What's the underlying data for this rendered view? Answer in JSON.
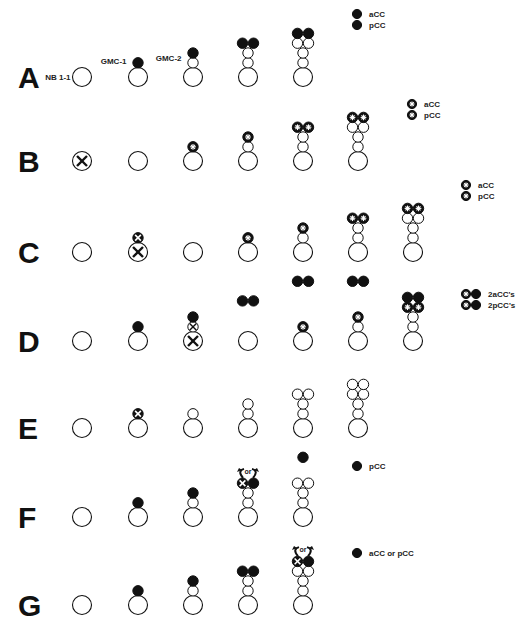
{
  "figure": {
    "cell_types": {
      "open": "unlabeled cell",
      "filled": "aCC/pCC (black)",
      "star": "aCC/pCC with star marker",
      "x": "ablated / killed cell"
    },
    "rows": [
      {
        "label": "A",
        "stages": [
          {
            "base_label": "NB 1-1",
            "stack": []
          },
          {
            "base_label": "GMC-1",
            "stack": [
              [
                "filled"
              ]
            ]
          },
          {
            "base_label": "GMC-2",
            "stack": [
              [
                "open"
              ],
              [
                "filled"
              ]
            ]
          },
          {
            "stack": [
              [
                "open"
              ],
              [
                "open"
              ],
              [
                "filled",
                "filled"
              ]
            ]
          },
          {
            "stack": [
              [
                "open"
              ],
              [
                "open"
              ],
              [
                "open",
                "open"
              ],
              [
                "filled",
                "filled"
              ]
            ]
          }
        ],
        "legend": [
          {
            "icons": [
              "filled"
            ],
            "text": "aCC"
          },
          {
            "icons": [
              "filled"
            ],
            "text": "pCC"
          }
        ]
      },
      {
        "label": "B",
        "stages": [
          {
            "base": "x",
            "stack": []
          },
          {
            "stack": []
          },
          {
            "stack": [
              [
                "star"
              ]
            ]
          },
          {
            "stack": [
              [
                "open"
              ],
              [
                "star"
              ]
            ]
          },
          {
            "stack": [
              [
                "open"
              ],
              [
                "open"
              ],
              [
                "star",
                "star"
              ]
            ]
          },
          {
            "stack": [
              [
                "open"
              ],
              [
                "open"
              ],
              [
                "open",
                "open"
              ],
              [
                "star",
                "star"
              ]
            ]
          }
        ],
        "legend": [
          {
            "icons": [
              "star"
            ],
            "text": "aCC"
          },
          {
            "icons": [
              "star"
            ],
            "text": "pCC"
          }
        ]
      },
      {
        "label": "C",
        "stages": [
          {
            "stack": []
          },
          {
            "base": "x",
            "stack": [
              [
                "x-small"
              ]
            ]
          },
          {
            "stack": []
          },
          {
            "stack": [
              [
                "star"
              ]
            ]
          },
          {
            "stack": [
              [
                "open"
              ],
              [
                "star"
              ]
            ]
          },
          {
            "stack": [
              [
                "open"
              ],
              [
                "open"
              ],
              [
                "star",
                "star"
              ]
            ]
          },
          {
            "stack": [
              [
                "open"
              ],
              [
                "open"
              ],
              [
                "open",
                "open"
              ],
              [
                "star",
                "star"
              ]
            ]
          }
        ],
        "legend": [
          {
            "icons": [
              "star"
            ],
            "text": "aCC"
          },
          {
            "icons": [
              "star"
            ],
            "text": "pCC"
          }
        ]
      },
      {
        "label": "D",
        "stages": [
          {
            "stack": []
          },
          {
            "stack": [
              [
                "filled"
              ]
            ]
          },
          {
            "base": "x",
            "stack": [
              [
                "x-open"
              ],
              [
                "filled"
              ]
            ]
          },
          {
            "stack": [],
            "floating": [
              "filled",
              "filled"
            ],
            "float_level": 3
          },
          {
            "stack": [
              [
                "star"
              ]
            ],
            "floating": [
              "filled",
              "filled"
            ],
            "float_level": 5
          },
          {
            "stack": [
              [
                "open"
              ],
              [
                "star"
              ]
            ],
            "floating": [
              "filled",
              "filled"
            ],
            "float_level": 5
          },
          {
            "stack": [
              [
                "open"
              ],
              [
                "open"
              ],
              [
                "star",
                "star"
              ],
              [
                "filled",
                "filled"
              ]
            ]
          }
        ],
        "legend": [
          {
            "icons": [
              "star",
              "filled"
            ],
            "text": "2aCC's"
          },
          {
            "icons": [
              "star",
              "filled"
            ],
            "text": "2pCC's"
          }
        ]
      },
      {
        "label": "E",
        "stages": [
          {
            "stack": []
          },
          {
            "stack": [
              [
                "x-small"
              ]
            ]
          },
          {
            "stack": [
              [
                "open"
              ]
            ]
          },
          {
            "stack": [
              [
                "open"
              ],
              [
                "open"
              ]
            ]
          },
          {
            "stack": [
              [
                "open"
              ],
              [
                "open"
              ],
              [
                "open",
                "open"
              ]
            ]
          },
          {
            "stack": [
              [
                "open"
              ],
              [
                "open"
              ],
              [
                "open",
                "open"
              ],
              [
                "open",
                "open"
              ]
            ]
          }
        ],
        "legend": []
      },
      {
        "label": "F",
        "stages": [
          {
            "stack": []
          },
          {
            "stack": [
              [
                "filled"
              ]
            ]
          },
          {
            "stack": [
              [
                "open"
              ],
              [
                "filled"
              ]
            ]
          },
          {
            "stack": [
              [
                "open"
              ],
              [
                "open"
              ],
              [
                "x-small",
                "filled"
              ]
            ],
            "or_arrow": true
          },
          {
            "stack": [
              [
                "open"
              ],
              [
                "open"
              ],
              [
                "open",
                "open"
              ]
            ],
            "floating": [
              "filled"
            ],
            "float_level": 5
          }
        ],
        "legend": [
          {
            "icons": [
              "filled"
            ],
            "text": "pCC"
          }
        ]
      },
      {
        "label": "G",
        "stages": [
          {
            "stack": []
          },
          {
            "stack": [
              [
                "filled"
              ]
            ]
          },
          {
            "stack": [
              [
                "open"
              ],
              [
                "filled"
              ]
            ]
          },
          {
            "stack": [
              [
                "open"
              ],
              [
                "open"
              ],
              [
                "filled",
                "filled"
              ]
            ]
          },
          {
            "stack": [
              [
                "open"
              ],
              [
                "open"
              ],
              [
                "open",
                "open"
              ],
              [
                "x-small",
                "filled"
              ]
            ],
            "or_arrow": true
          }
        ],
        "legend": [
          {
            "icons": [
              "filled"
            ],
            "text": "aCC or pCC"
          }
        ]
      }
    ],
    "or_label": "or"
  }
}
